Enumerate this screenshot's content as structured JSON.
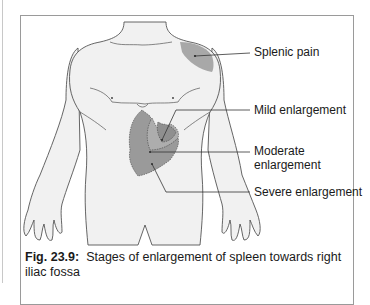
{
  "figure": {
    "labels": {
      "splenic_pain": "Splenic pain",
      "mild": "Mild enlargement",
      "moderate_line1": "Moderate",
      "moderate_line2": "enlargement",
      "severe": "Severe enlargement"
    },
    "caption": {
      "number": "Fig. 23.9:",
      "text": "Stages of enlargement of spleen towards right iliac fossa"
    },
    "colors": {
      "skin": "#f1f1f1",
      "outline": "#555555",
      "shade_light": "#b8b8b8",
      "shade_mid": "#a3a3a3",
      "shade_dark": "#8f8f8f",
      "leader": "#333333"
    }
  }
}
